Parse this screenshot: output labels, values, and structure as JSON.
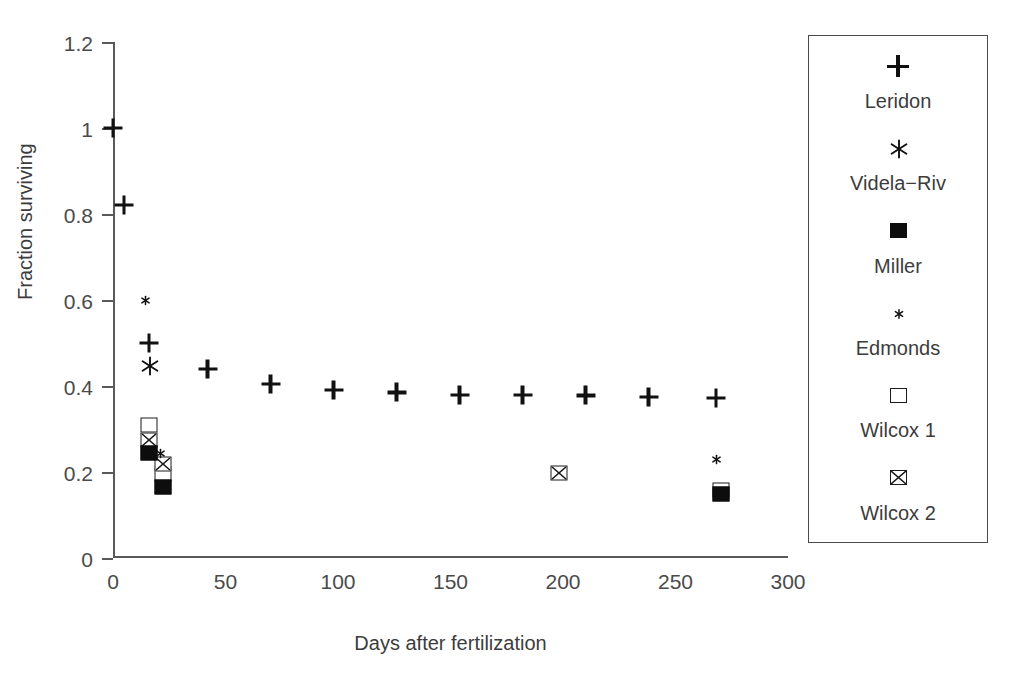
{
  "chart_data": {
    "type": "scatter",
    "title": "",
    "xlabel": "Days after fertilization",
    "ylabel": "Fraction surviving",
    "xlim": [
      0,
      300
    ],
    "ylim": [
      0,
      1.2
    ],
    "xticks": [
      0,
      50,
      100,
      150,
      200,
      250,
      300
    ],
    "xtick_labels": [
      "0",
      "50",
      "100",
      "150",
      "200",
      "250",
      "300"
    ],
    "yticks": [
      0,
      0.2,
      0.4,
      0.6,
      0.8,
      1,
      1.2
    ],
    "ytick_labels": [
      "0",
      "0.2",
      "0.4",
      "0.6",
      "0.8",
      "1",
      "1.2"
    ],
    "grid": false,
    "legend_position": "right-outside",
    "series": [
      {
        "name": "Leridon",
        "marker": "plus",
        "points": [
          {
            "x": 0,
            "y": 1.0
          },
          {
            "x": 5,
            "y": 0.82
          },
          {
            "x": 16,
            "y": 0.5
          },
          {
            "x": 42,
            "y": 0.44
          },
          {
            "x": 70,
            "y": 0.405
          },
          {
            "x": 98,
            "y": 0.39
          },
          {
            "x": 126,
            "y": 0.385
          },
          {
            "x": 154,
            "y": 0.38
          },
          {
            "x": 182,
            "y": 0.38
          },
          {
            "x": 210,
            "y": 0.378
          },
          {
            "x": 238,
            "y": 0.375
          },
          {
            "x": 268,
            "y": 0.373
          }
        ]
      },
      {
        "name": "Videla-Riv",
        "marker": "asterisk",
        "points": [
          {
            "x": 16,
            "y": 0.45
          }
        ]
      },
      {
        "name": "Miller",
        "marker": "filled-square",
        "points": [
          {
            "x": 16,
            "y": 0.245
          },
          {
            "x": 22,
            "y": 0.165
          },
          {
            "x": 270,
            "y": 0.148
          }
        ]
      },
      {
        "name": "Edmonds",
        "marker": "small-asterisk",
        "points": [
          {
            "x": 14,
            "y": 0.6
          },
          {
            "x": 21,
            "y": 0.245
          },
          {
            "x": 268,
            "y": 0.23
          }
        ]
      },
      {
        "name": "Wilcox 1",
        "marker": "open-square",
        "points": [
          {
            "x": 16,
            "y": 0.31
          },
          {
            "x": 22,
            "y": 0.195
          },
          {
            "x": 270,
            "y": 0.158
          }
        ]
      },
      {
        "name": "Wilcox 2",
        "marker": "crossed-square",
        "points": [
          {
            "x": 16,
            "y": 0.275
          },
          {
            "x": 22,
            "y": 0.218
          },
          {
            "x": 198,
            "y": 0.197
          }
        ]
      }
    ]
  },
  "legend": {
    "entries": [
      {
        "label": "Leridon",
        "marker": "plus"
      },
      {
        "label": "Videla−Riv",
        "marker": "asterisk"
      },
      {
        "label": "Miller",
        "marker": "filled-square"
      },
      {
        "label": "Edmonds",
        "marker": "small-asterisk"
      },
      {
        "label": "Wilcox 1",
        "marker": "open-square"
      },
      {
        "label": "Wilcox 2",
        "marker": "crossed-square"
      }
    ]
  },
  "colors": {
    "marker": "#111111",
    "axis": "#5a5a5a",
    "text": "#3c3c3c",
    "background": "#ffffff"
  }
}
